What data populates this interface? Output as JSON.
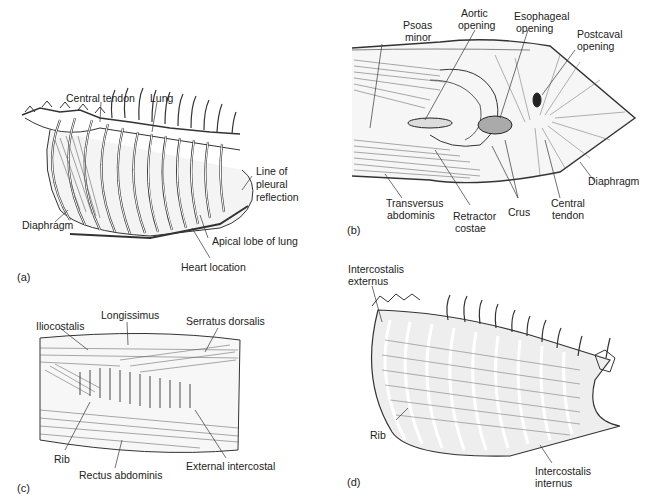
{
  "panels": {
    "a": {
      "tag": "(a)",
      "labels": {
        "central_tendon": "Central tendon",
        "lung": "Lung",
        "line_of_pleural_reflection_1": "Line of",
        "line_of_pleural_reflection_2": "pleural",
        "line_of_pleural_reflection_3": "reflection",
        "diaphragm": "Diaphragm",
        "apical_lobe": "Apical lobe of lung",
        "heart_location": "Heart location"
      }
    },
    "b": {
      "tag": "(b)",
      "labels": {
        "psoas_1": "Psoas",
        "psoas_2": "minor",
        "aortic_1": "Aortic",
        "aortic_2": "opening",
        "esophageal_1": "Esophageal",
        "esophageal_2": "opening",
        "postcaval_1": "Postcaval",
        "postcaval_2": "opening",
        "diaphragm": "Diaphragm",
        "transversus_1": "Transversus",
        "transversus_2": "abdominis",
        "retractor_1": "Retractor",
        "retractor_2": "costae",
        "crus": "Crus",
        "central_tendon_1": "Central",
        "central_tendon_2": "tendon"
      }
    },
    "c": {
      "tag": "(c)",
      "labels": {
        "iliocostalis": "Iliocostalis",
        "longissimus": "Longissimus",
        "serratus_dorsalis": "Serratus dorsalis",
        "rib": "Rib",
        "rectus_abdominis": "Rectus abdominis",
        "external_intercostal": "External intercostal"
      }
    },
    "d": {
      "tag": "(d)",
      "labels": {
        "intercostalis_externus_1": "Intercostalis",
        "intercostalis_externus_2": "externus",
        "rib": "Rib",
        "intercostalis_internus_1": "Intercostalis",
        "intercostalis_internus_2": "internus"
      }
    }
  }
}
